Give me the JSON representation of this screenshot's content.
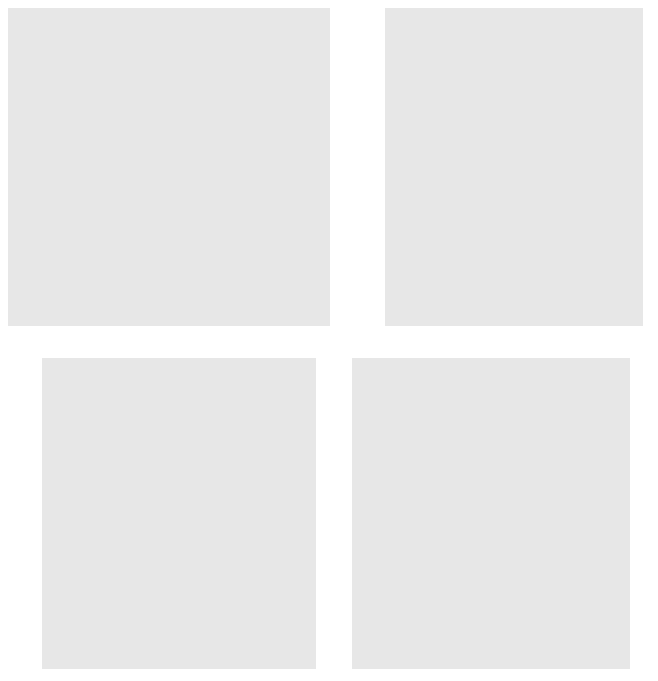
{
  "figure": {
    "background": "#ffffff",
    "panel_background": "#e7e7e7",
    "plot_background": "#ffffff",
    "marker_color": "#1a1a1a",
    "axis_color": "#4a4a4a"
  },
  "chart_data": [
    {
      "id": "a",
      "type": "scatter",
      "letter": "(a)",
      "title": "",
      "xlabel": "Boats registered in Florida (thousands)",
      "ylabel": "Florida manatees killed by boats",
      "xlim": [
        380,
        1120
      ],
      "ylim": [
        5,
        103
      ],
      "xticks": [
        400,
        500,
        600,
        700,
        800,
        900,
        1000,
        1100
      ],
      "yticks": [
        10,
        20,
        30,
        40,
        50,
        60,
        70,
        80,
        90,
        100
      ],
      "grid": false,
      "legend": "none",
      "points": [
        [
          447,
          13
        ],
        [
          460,
          21
        ],
        [
          481,
          24
        ],
        [
          498,
          16
        ],
        [
          513,
          24
        ],
        [
          512,
          20
        ],
        [
          526,
          15
        ],
        [
          559,
          34
        ],
        [
          585,
          33
        ],
        [
          614,
          33
        ],
        [
          645,
          39
        ],
        [
          675,
          43
        ],
        [
          676,
          38
        ],
        [
          678,
          35
        ],
        [
          681,
          53
        ],
        [
          697,
          49
        ],
        [
          707,
          50
        ],
        [
          710,
          47
        ],
        [
          711,
          42
        ],
        [
          719,
          47
        ],
        [
          721,
          60
        ],
        [
          733,
          54
        ],
        [
          809,
          66
        ],
        [
          830,
          82
        ],
        [
          880,
          78
        ],
        [
          944,
          81
        ],
        [
          956,
          95
        ],
        [
          978,
          73
        ],
        [
          982,
          69
        ],
        [
          1010,
          79
        ],
        [
          1024,
          92
        ]
      ]
    },
    {
      "id": "b",
      "type": "scatter",
      "letter": "(b)",
      "title": "",
      "xlabel": "Storms predicted",
      "ylabel": "Storms observed",
      "xlim": [
        -1,
        31
      ],
      "ylim": [
        -1,
        31
      ],
      "xticks": [
        0,
        5,
        10,
        15,
        20,
        25,
        30
      ],
      "yticks": [
        0,
        5,
        10,
        15,
        20,
        25,
        30
      ],
      "grid": false,
      "legend": "none",
      "points": [
        [
          7,
          11
        ],
        [
          8,
          8
        ],
        [
          8,
          7
        ],
        [
          8,
          6
        ],
        [
          9,
          7
        ],
        [
          10,
          14
        ],
        [
          10,
          13
        ],
        [
          10,
          12
        ],
        [
          11,
          14
        ],
        [
          11,
          12
        ],
        [
          11,
          11
        ],
        [
          11,
          8
        ],
        [
          11,
          7
        ],
        [
          12,
          19
        ],
        [
          12,
          15
        ],
        [
          12,
          14
        ],
        [
          13,
          16
        ],
        [
          14,
          14
        ],
        [
          14,
          12
        ],
        [
          15,
          27
        ],
        [
          17,
          14
        ],
        [
          17,
          9
        ]
      ]
    },
    {
      "id": "c",
      "type": "scatter",
      "letter": "(c)",
      "title": "",
      "xlabel": "Healing rate limb 1",
      "ylabel": "Healing rate limb 2",
      "xlim": [
        8,
        45
      ],
      "ylim": [
        8,
        45
      ],
      "xticks": [
        10,
        20,
        30,
        40
      ],
      "yticks": [
        10,
        20,
        30,
        40
      ],
      "grid": false,
      "legend": "none",
      "points": [
        [
          14.8,
          28.1
        ],
        [
          16.7,
          12.3
        ],
        [
          16.8,
          11.2
        ],
        [
          19.0,
          14.2
        ],
        [
          20.6,
          35.2
        ],
        [
          20.6,
          22.1
        ],
        [
          21.2,
          22.1
        ],
        [
          20.9,
          18.1
        ],
        [
          21.6,
          29.2
        ],
        [
          24.0,
          40.2
        ],
        [
          24.1,
          26.2
        ],
        [
          25.0,
          33.1
        ],
        [
          29.7,
          34.1
        ],
        [
          30.6,
          35.1
        ],
        [
          32.9,
          23.1
        ],
        [
          35.8,
          23.1
        ],
        [
          40.8,
          30.1
        ],
        [
          41.9,
          27.2
        ]
      ]
    },
    {
      "id": "d",
      "type": "scatter",
      "letter": "(d)",
      "title": "",
      "xlabel": "Last year's percent return",
      "ylabel": "This year's percent return",
      "xlim": [
        -32,
        64
      ],
      "ylim": [
        -32,
        64
      ],
      "xticks": [
        -20,
        0,
        20,
        40,
        60
      ],
      "yticks": [
        -20,
        0,
        20,
        40,
        60
      ],
      "grid": false,
      "legend": "none",
      "points": [
        [
          -28,
          37
        ],
        [
          -24,
          31
        ],
        [
          -19,
          -29
        ],
        [
          -11,
          45
        ],
        [
          -11,
          21
        ],
        [
          -11,
          0
        ],
        [
          -11,
          -11
        ],
        [
          -11,
          -21
        ],
        [
          -8,
          28
        ],
        [
          -7,
          33
        ],
        [
          -5,
          20
        ],
        [
          -3,
          36
        ],
        [
          -2,
          26
        ],
        [
          -2,
          8
        ],
        [
          -1,
          50
        ],
        [
          0,
          17
        ],
        [
          1,
          31
        ],
        [
          2,
          17
        ],
        [
          4,
          24
        ],
        [
          5,
          10
        ],
        [
          8,
          6
        ],
        [
          9,
          -11
        ],
        [
          12,
          0
        ],
        [
          13,
          -1
        ],
        [
          14,
          1
        ],
        [
          14,
          28
        ],
        [
          15,
          1
        ],
        [
          15,
          -11
        ],
        [
          15,
          -12
        ],
        [
          16,
          17
        ],
        [
          17,
          14
        ],
        [
          18,
          22
        ],
        [
          18,
          3
        ],
        [
          18,
          -19
        ],
        [
          19,
          33
        ],
        [
          20,
          32
        ],
        [
          20,
          16
        ],
        [
          20,
          24
        ],
        [
          21,
          8
        ],
        [
          22,
          16
        ],
        [
          22,
          -4
        ],
        [
          23,
          -11
        ],
        [
          24,
          13
        ],
        [
          25,
          -11
        ],
        [
          25,
          21
        ],
        [
          26,
          17
        ],
        [
          27,
          24
        ],
        [
          28,
          -11
        ],
        [
          28,
          12
        ],
        [
          29,
          9
        ],
        [
          30,
          21
        ],
        [
          32,
          -4
        ],
        [
          33,
          9
        ],
        [
          36,
          26
        ],
        [
          37,
          21
        ],
        [
          45,
          12
        ],
        [
          51,
          25
        ]
      ]
    }
  ]
}
